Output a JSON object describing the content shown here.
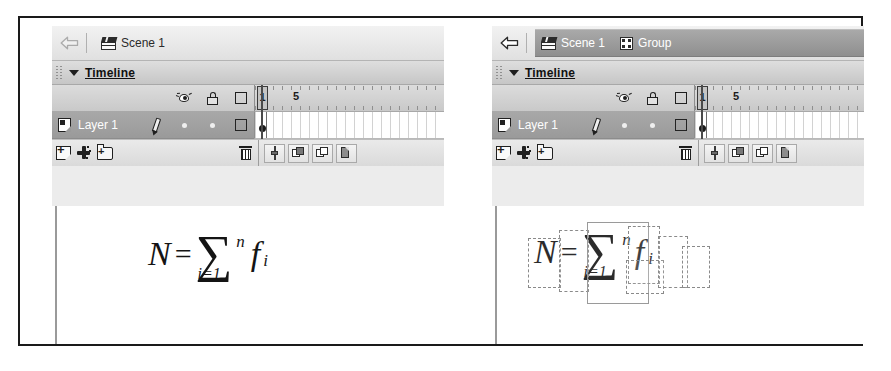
{
  "app": {
    "name": "Flash Timeline Panels",
    "panel_count": 2
  },
  "panels": [
    {
      "id": "left",
      "breadcrumb": {
        "back_arrow_icon": "back-arrow-icon",
        "back_arrow_enabled": false,
        "highlighted": false,
        "items": [
          {
            "label": "Scene 1",
            "icon": "clapperboard-icon"
          }
        ]
      },
      "timeline": {
        "title": "Timeline",
        "collapse_icon": "triangle-down-icon",
        "grip_icon": "drag-grip-icon",
        "column_headers": [
          {
            "name": "show-hide-column",
            "icon": "eye-icon"
          },
          {
            "name": "lock-column",
            "icon": "lock-icon"
          },
          {
            "name": "outline-column",
            "icon": "square-outline-icon"
          }
        ],
        "layers": [
          {
            "name": "Layer 1",
            "icon": "page-icon",
            "selected": true,
            "edit_icon": "pencil-icon",
            "visible_marker": "dot",
            "lock_marker": "dot",
            "outline_marker": "square-outline-icon"
          }
        ],
        "ruler": {
          "ticks_every": 5,
          "labels": [
            {
              "frame": "1",
              "is_playhead": true
            },
            {
              "frame": "5",
              "is_playhead": false
            }
          ]
        },
        "frames": {
          "current_frame": "1",
          "keyframes": [
            "1"
          ]
        },
        "footer": {
          "left_tools": [
            {
              "name": "new-layer-button",
              "icon": "new-layer-icon"
            },
            {
              "name": "add-motion-guide-button",
              "icon": "motion-guide-icon"
            },
            {
              "name": "new-folder-button",
              "icon": "new-folder-icon"
            }
          ],
          "delete_tool": {
            "name": "delete-layer-button",
            "icon": "trash-icon"
          },
          "right_tools": [
            {
              "name": "center-frame-button",
              "icon": "center-frame-icon"
            },
            {
              "name": "onion-skin-button",
              "icon": "onion-skin-icon"
            },
            {
              "name": "onion-skin-outlines-button",
              "icon": "onion-skin-outlines-icon"
            },
            {
              "name": "edit-multiple-frames-button",
              "icon": "edit-multiple-frames-icon"
            }
          ]
        }
      },
      "stage": {
        "selection_boxes_visible": false,
        "formula": {
          "lhs": "N",
          "operator": "=",
          "sigma": "∑",
          "sigma_upper": "n",
          "sigma_lower": "i=1",
          "term": "f",
          "term_subscript": "i"
        }
      }
    },
    {
      "id": "right",
      "breadcrumb": {
        "back_arrow_icon": "back-arrow-icon",
        "back_arrow_enabled": true,
        "highlighted": true,
        "items": [
          {
            "label": "Scene 1",
            "icon": "clapperboard-icon"
          },
          {
            "label": "Group",
            "icon": "group-icon"
          }
        ]
      },
      "timeline": {
        "title": "Timeline",
        "collapse_icon": "triangle-down-icon",
        "grip_icon": "drag-grip-icon",
        "column_headers": [
          {
            "name": "show-hide-column",
            "icon": "eye-icon"
          },
          {
            "name": "lock-column",
            "icon": "lock-icon"
          },
          {
            "name": "outline-column",
            "icon": "square-outline-icon"
          }
        ],
        "layers": [
          {
            "name": "Layer 1",
            "icon": "page-icon",
            "selected": true,
            "edit_icon": "pencil-icon",
            "visible_marker": "dot",
            "lock_marker": "dot",
            "outline_marker": "square-outline-icon"
          }
        ],
        "ruler": {
          "ticks_every": 5,
          "labels": [
            {
              "frame": "1",
              "is_playhead": true
            },
            {
              "frame": "5",
              "is_playhead": false
            }
          ]
        },
        "frames": {
          "current_frame": "1",
          "keyframes": [
            "1"
          ]
        },
        "footer": {
          "left_tools": [
            {
              "name": "new-layer-button",
              "icon": "new-layer-icon"
            },
            {
              "name": "add-motion-guide-button",
              "icon": "motion-guide-icon"
            },
            {
              "name": "new-folder-button",
              "icon": "new-folder-icon"
            }
          ],
          "delete_tool": {
            "name": "delete-layer-button",
            "icon": "trash-icon"
          },
          "right_tools": [
            {
              "name": "center-frame-button",
              "icon": "center-frame-icon"
            },
            {
              "name": "onion-skin-button",
              "icon": "onion-skin-icon"
            },
            {
              "name": "onion-skin-outlines-button",
              "icon": "onion-skin-outlines-icon"
            },
            {
              "name": "edit-multiple-frames-button",
              "icon": "edit-multiple-frames-icon"
            }
          ]
        }
      },
      "stage": {
        "selection_boxes_visible": true,
        "formula": {
          "lhs": "N",
          "operator": "=",
          "sigma": "∑",
          "sigma_upper": "n",
          "sigma_lower": "i=1",
          "term": "f",
          "term_subscript": "i"
        }
      }
    }
  ],
  "colors": {
    "panel_background": "#ececec",
    "header_gradient_top": "#f2f2f2",
    "header_gradient_bottom": "#e0e0e0",
    "breadcrumb_highlight": "#9a9a9a",
    "layer_selected": "#a0a0a0",
    "timeline_title_bar": "#d2d2d2",
    "frame_grid_line": "#d2d2d2",
    "outer_border": "#1a1a1a",
    "text_dark": "#1b1b1b",
    "text_light": "#fdfdfd",
    "selection_box_border": "#8a8a8a"
  }
}
